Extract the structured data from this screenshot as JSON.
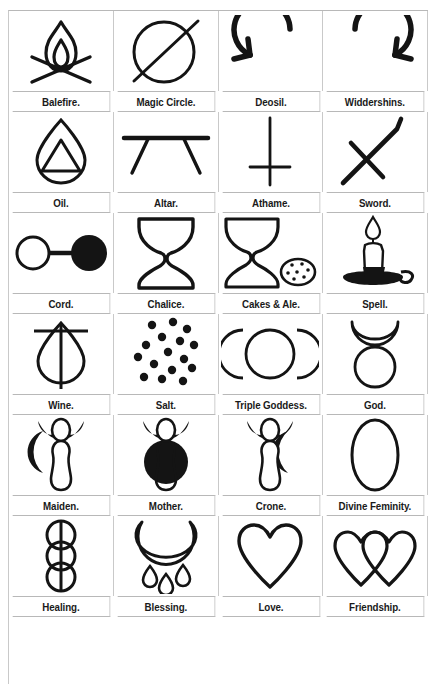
{
  "page": {
    "columns": 4,
    "rows": 6,
    "stroke_color": "#141414",
    "fill_color": "#141414",
    "background_color": "#ffffff",
    "grid_line_color": "#c9c9c9"
  },
  "grid": [
    [
      {
        "label": "Balefire.",
        "icon": "balefire-icon"
      },
      {
        "label": "Magic Circle.",
        "icon": "magic-circle-icon"
      },
      {
        "label": "Deosil.",
        "icon": "deosil-icon"
      },
      {
        "label": "Widdershins.",
        "icon": "widdershins-icon"
      }
    ],
    [
      {
        "label": "Oil.",
        "icon": "oil-icon"
      },
      {
        "label": "Altar.",
        "icon": "altar-icon"
      },
      {
        "label": "Athame.",
        "icon": "athame-icon"
      },
      {
        "label": "Sword.",
        "icon": "sword-icon"
      }
    ],
    [
      {
        "label": "Cord.",
        "icon": "cord-icon"
      },
      {
        "label": "Chalice.",
        "icon": "chalice-icon"
      },
      {
        "label": "Cakes & Ale.",
        "icon": "cakes-and-ale-icon"
      },
      {
        "label": "Spell.",
        "icon": "spell-candle-icon"
      }
    ],
    [
      {
        "label": "Wine.",
        "icon": "wine-icon"
      },
      {
        "label": "Salt.",
        "icon": "salt-icon"
      },
      {
        "label": "Triple Goddess.",
        "icon": "triple-goddess-icon"
      },
      {
        "label": "God.",
        "icon": "god-horned-icon"
      }
    ],
    [
      {
        "label": "Maiden.",
        "icon": "maiden-icon"
      },
      {
        "label": "Mother.",
        "icon": "mother-icon"
      },
      {
        "label": "Crone.",
        "icon": "crone-icon"
      },
      {
        "label": "Divine Feminity.",
        "icon": "divine-feminity-icon"
      }
    ],
    [
      {
        "label": "Healing.",
        "icon": "healing-icon"
      },
      {
        "label": "Blessing.",
        "icon": "blessing-icon"
      },
      {
        "label": "Love.",
        "icon": "love-heart-icon"
      },
      {
        "label": "Friendship.",
        "icon": "friendship-hearts-icon"
      }
    ]
  ]
}
